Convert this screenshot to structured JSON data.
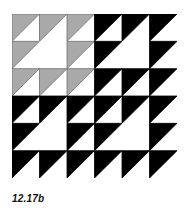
{
  "figure": {
    "caption": "12.17b",
    "grid": {
      "rows": 6,
      "cols": 6
    },
    "colors": {
      "gray": "#a9a9a9",
      "gray_outline": "#6e6e6e",
      "black": "#000000",
      "white": "#ffffff"
    },
    "cells": [
      [
        "G",
        "G",
        "G",
        "B",
        "B",
        "B"
      ],
      [
        "G",
        "W",
        "G",
        "B",
        "W",
        "B"
      ],
      [
        "G",
        "G",
        "G",
        "B",
        "B",
        "B"
      ],
      [
        "B",
        "B",
        "B",
        "B",
        "B",
        "B"
      ],
      [
        "B",
        "W",
        "B",
        "B",
        "W",
        "B"
      ],
      [
        "B",
        "B",
        "B",
        "B",
        "B",
        "B"
      ]
    ],
    "legend": {
      "G": "gray upper-left half-square triangle",
      "B": "black upper-left half-square triangle",
      "W": "plain white square (part of large white triangle)"
    }
  }
}
